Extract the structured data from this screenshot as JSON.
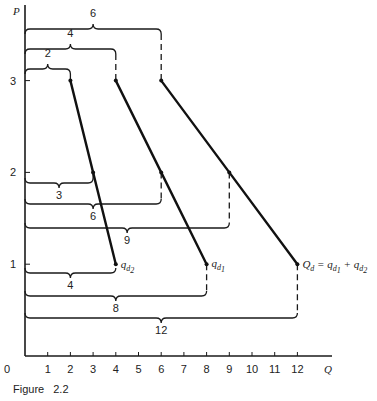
{
  "figure": {
    "caption": "Figure 2.2",
    "p_label": "P",
    "q_label": "Q"
  },
  "chart_data": {
    "type": "line",
    "title": "",
    "xlabel": "Q",
    "ylabel": "P",
    "xlim": [
      0,
      12
    ],
    "ylim": [
      0,
      3
    ],
    "x_ticks": [
      0,
      1,
      2,
      3,
      4,
      5,
      6,
      7,
      8,
      9,
      10,
      11,
      12
    ],
    "y_ticks": [
      1,
      2,
      3
    ],
    "grid": false,
    "series": [
      {
        "name": "q_d2",
        "label": "q",
        "sub": "d",
        "subsub": "2",
        "points": [
          [
            2,
            3
          ],
          [
            3,
            2
          ],
          [
            4,
            1
          ]
        ]
      },
      {
        "name": "q_d1",
        "label": "q",
        "sub": "d",
        "subsub": "1",
        "points": [
          [
            4,
            3
          ],
          [
            6,
            2
          ],
          [
            8,
            1
          ]
        ]
      },
      {
        "name": "Q_d",
        "label": "Q_d = q_d1 + q_d2",
        "points": [
          [
            6,
            3
          ],
          [
            9,
            2
          ],
          [
            12,
            1
          ]
        ]
      }
    ],
    "annotations": [
      {
        "price": 3,
        "quantity": 2,
        "text": "2",
        "level": 3
      },
      {
        "price": 3,
        "quantity": 4,
        "text": "4",
        "level": 2
      },
      {
        "price": 3,
        "quantity": 6,
        "text": "6",
        "level": 1
      },
      {
        "price": 2,
        "quantity": 3,
        "text": "3",
        "level": 1
      },
      {
        "price": 2,
        "quantity": 6,
        "text": "6",
        "level": 2
      },
      {
        "price": 2,
        "quantity": 9,
        "text": "9",
        "level": 3
      },
      {
        "price": 1,
        "quantity": 4,
        "text": "4",
        "level": 1
      },
      {
        "price": 1,
        "quantity": 8,
        "text": "8",
        "level": 2
      },
      {
        "price": 1,
        "quantity": 12,
        "text": "12",
        "level": 3
      }
    ]
  },
  "layout": {
    "x0": 25,
    "y0": 356,
    "xunit": 22.7,
    "yunit": 91.8,
    "axis_top": 5,
    "axis_right": 332,
    "brace_rows": [
      {
        "y": 29,
        "label_y": 17,
        "qty": 6,
        "above": true
      },
      {
        "y": 49,
        "label_y": 37,
        "qty": 4,
        "above": true
      },
      {
        "y": 69,
        "label_y": 57,
        "qty": 2,
        "above": true
      },
      {
        "y": 183,
        "label_y": 199,
        "qty": 3,
        "above": false,
        "p": 2
      },
      {
        "y": 204,
        "label_y": 220,
        "qty": 6,
        "above": false,
        "p": 2
      },
      {
        "y": 228,
        "label_y": 244,
        "qty": 9,
        "above": false,
        "p": 2
      },
      {
        "y": 273,
        "label_y": 289,
        "qty": 4,
        "above": false,
        "p": 1
      },
      {
        "y": 296,
        "label_y": 312,
        "qty": 8,
        "above": false,
        "p": 1
      },
      {
        "y": 318,
        "label_y": 334,
        "qty": 12,
        "above": false,
        "p": 1
      }
    ]
  }
}
